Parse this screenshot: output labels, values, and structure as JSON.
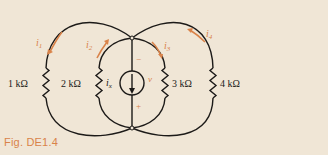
{
  "figure": {
    "caption": "Fig. DE1.4",
    "colors": {
      "background": "#f0e6d6",
      "wire": "#1c1a18",
      "accent": "#d9834a"
    },
    "resistors": [
      {
        "id": "R1",
        "label": "1 kΩ"
      },
      {
        "id": "R2",
        "label": "2 kΩ"
      },
      {
        "id": "R3",
        "label": "3 kΩ"
      },
      {
        "id": "R4",
        "label": "4 kΩ"
      }
    ],
    "currents": [
      {
        "id": "i1",
        "label": "i",
        "sub": "1"
      },
      {
        "id": "i2",
        "label": "i",
        "sub": "2"
      },
      {
        "id": "i3",
        "label": "i",
        "sub": "3"
      },
      {
        "id": "i4",
        "label": "i",
        "sub": "4"
      }
    ],
    "source": {
      "label": "i",
      "sub": "x",
      "voltage_label": "v",
      "plus": "+",
      "minus": "−"
    }
  }
}
